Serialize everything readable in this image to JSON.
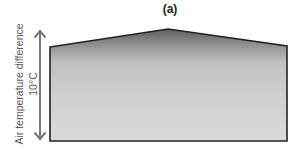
{
  "figure": {
    "panel_label": "(a)",
    "y_axis_label": "Air temperature difference",
    "y_axis_value": "10°C"
  },
  "shape": {
    "type": "building-cross-section",
    "description": "house-shaped room outline with gradient fill darker near ceiling",
    "fill_top_color": "#6e6e6e",
    "fill_mid_color": "#c4c4c4",
    "fill_bottom_color": "#d9d9d9",
    "outline_color": "#222222"
  },
  "arrow": {
    "type": "double-headed-vertical",
    "color": "#777777"
  }
}
